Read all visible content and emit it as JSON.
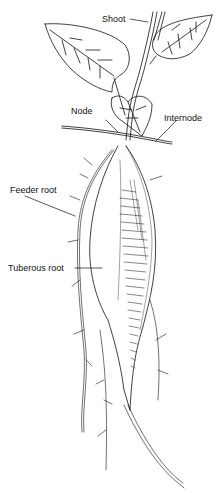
{
  "diagram": {
    "labels": {
      "shoot": "Shoot",
      "node": "Node",
      "internode": "Internode",
      "feeder_root": "Feeder root",
      "tuberous_root": "Tuberous root"
    },
    "colors": {
      "ink": "#111111",
      "background": "#ffffff"
    }
  }
}
